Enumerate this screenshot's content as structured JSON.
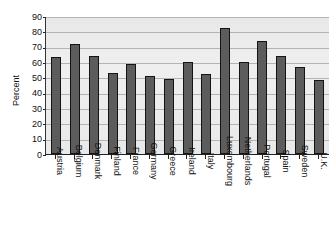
{
  "chart_data": {
    "type": "bar",
    "title": "",
    "subtitle": "",
    "xlabel": "",
    "ylabel": "Percent",
    "ylim": [
      0,
      90
    ],
    "ytick_step": 10,
    "yticks": [
      90,
      80,
      70,
      60,
      50,
      40,
      30,
      20,
      10,
      0
    ],
    "grid": true,
    "legend": false,
    "legend_position": "none",
    "orientation": "vertical",
    "categories": [
      "Austria",
      "Belgium",
      "Denmark",
      "Finland",
      "France",
      "Germany",
      "Greece",
      "Ireland",
      "Italy",
      "Luxembourg",
      "Netherlands",
      "Portugal",
      "Spain",
      "Sweden",
      "U.K."
    ],
    "values": [
      63,
      72,
      64,
      53,
      59,
      51,
      49,
      60,
      52,
      82,
      60,
      74,
      64,
      57,
      48
    ],
    "series": [
      {
        "name": "Percent",
        "values": [
          63,
          72,
          64,
          53,
          59,
          51,
          49,
          60,
          52,
          82,
          60,
          74,
          64,
          57,
          48
        ]
      }
    ]
  },
  "style": {
    "bar_fill": "#5c5c5c",
    "bar_border": "#141414",
    "plot_background": "#eeeeee",
    "gridline_color": "#b3b3b3",
    "axis_color": "#222222",
    "text_color": "#111111",
    "page_background": "#ffffff"
  }
}
